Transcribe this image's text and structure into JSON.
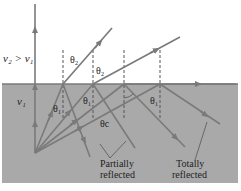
{
  "diagram": {
    "colors": {
      "medium_fill": "#a9a9a9",
      "interface_line": "#7a7a7a",
      "ray": "#7a7a7a",
      "normal_dashed": "#555555",
      "text": "#222222",
      "background": "#ffffff"
    },
    "labels": {
      "speed_relation": "v₂ > v₁",
      "medium_speed": "v₁",
      "theta_2_a": "θ₂",
      "theta_2_b": "θ₂",
      "theta_1_a": "θ₁",
      "theta_1_b": "θ₁",
      "theta_1_c": "θ₁",
      "theta_c": "θc",
      "partially_reflected_line1": "Partially",
      "partially_reflected_line2": "reflected",
      "totally_reflected_line1": "Totally",
      "totally_reflected_line2": "reflected"
    }
  }
}
